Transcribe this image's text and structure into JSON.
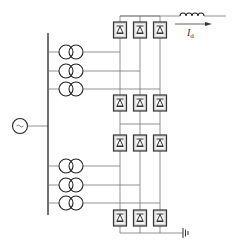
{
  "diagram": {
    "type": "circuit-schematic",
    "source": {
      "icon": "ac-source-icon",
      "symbol": "~"
    },
    "transformer_groups": [
      {
        "name": "upper",
        "count": 3
      },
      {
        "name": "lower",
        "count": 3
      }
    ],
    "bridge_rows": 4,
    "bridge_columns": 3,
    "output": {
      "current_label": "I",
      "current_subscript": "d",
      "inductor": "smoothing-reactor"
    },
    "ground": "ground-icon"
  }
}
